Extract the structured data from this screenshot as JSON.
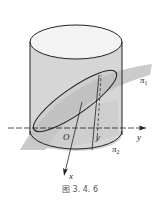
{
  "figure": {
    "caption": "图 3. 4. 6",
    "labels": {
      "origin": "O",
      "y_axis": "y",
      "x_axis": "x",
      "y_point": "y",
      "plane1": "π",
      "plane1_sub": "1",
      "plane2": "π",
      "plane2_sub": "2"
    },
    "colors": {
      "cylinder_body": "#d4d4d4",
      "cylinder_top": "#f2f2f2",
      "plane": "#bdbdbd",
      "stroke": "#222222"
    }
  }
}
